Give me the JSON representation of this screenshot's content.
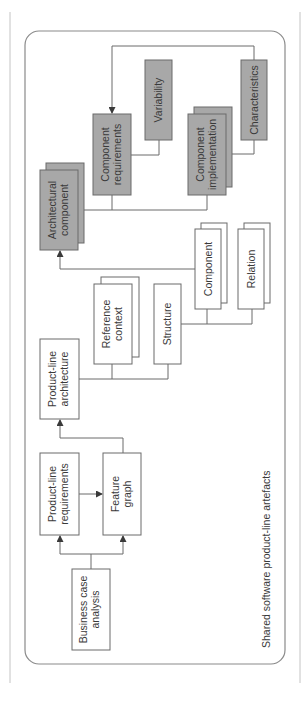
{
  "diagram": {
    "caption": "Shared software product-line artefacts",
    "colors": {
      "line": "#6a6a6a",
      "box_fill_white": "#ffffff",
      "box_fill_grey": "#a8a8a8",
      "text": "#3a3a3a",
      "frame": "#9a9a9a"
    },
    "nodes": {
      "business_case": {
        "line1": "Business case",
        "line2": "analysis",
        "style": "white"
      },
      "pl_requirements": {
        "line1": "Product-line",
        "line2": "requirements",
        "style": "white"
      },
      "feature_graph": {
        "line1": "Feature",
        "line2": "graph",
        "style": "white"
      },
      "pl_architecture": {
        "line1": "Product-line",
        "line2": "architecture",
        "style": "white"
      },
      "reference_context": {
        "line1": "Reference",
        "line2": "context",
        "style": "white-stacked"
      },
      "structure": {
        "line1": "Structure",
        "style": "white"
      },
      "component": {
        "line1": "Component",
        "style": "white-stacked"
      },
      "relation": {
        "line1": "Relation",
        "style": "white-stacked"
      },
      "architectural_component": {
        "line1": "Architectural",
        "line2": "component",
        "style": "grey-stacked"
      },
      "component_requirements": {
        "line1": "Component",
        "line2": "requirements",
        "style": "grey"
      },
      "variability": {
        "line1": "Variability",
        "style": "grey"
      },
      "component_implementation": {
        "line1": "Component",
        "line2": "implementation",
        "style": "grey-stacked"
      },
      "characteristics": {
        "line1": "Characteristics",
        "style": "grey"
      }
    },
    "edges": [
      {
        "from": "Business case analysis",
        "to": "Product-line requirements",
        "arrow": true
      },
      {
        "from": "Business case analysis",
        "to": "Feature graph",
        "arrow": true
      },
      {
        "from": "Product-line requirements",
        "to": "Feature graph",
        "arrow": true
      },
      {
        "from": "Feature graph",
        "to": "Product-line architecture",
        "arrow": true
      },
      {
        "from": "Product-line architecture",
        "to": "Reference context",
        "arrow": false
      },
      {
        "from": "Product-line architecture",
        "to": "Structure",
        "arrow": false
      },
      {
        "from": "Structure",
        "to": "Component",
        "arrow": false
      },
      {
        "from": "Structure",
        "to": "Relation",
        "arrow": false
      },
      {
        "from": "Component",
        "to": "Architectural component",
        "arrow": true
      },
      {
        "from": "Architectural component",
        "to": "Component requirements",
        "arrow": false
      },
      {
        "from": "Architectural component",
        "to": "Component implementation",
        "arrow": false
      },
      {
        "from": "Component requirements",
        "to": "Variability",
        "arrow": false
      },
      {
        "from": "Component implementation",
        "to": "Characteristics",
        "arrow": false
      },
      {
        "from": "Characteristics",
        "to": "Component requirements",
        "arrow": true
      }
    ]
  }
}
